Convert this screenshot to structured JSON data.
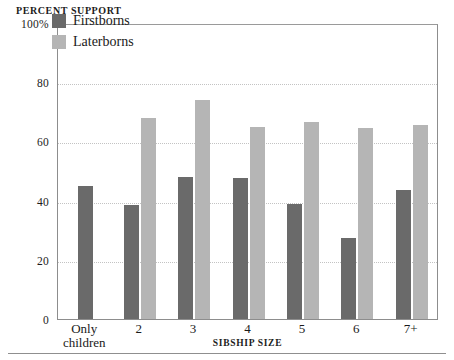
{
  "chart_data": {
    "type": "bar",
    "title": "",
    "ylabel": "PERCENT SUPPORT",
    "xlabel": "SIBSHIP SIZE",
    "ylim": [
      0,
      100
    ],
    "yticks": [
      0,
      20,
      40,
      60,
      80,
      100
    ],
    "ytick_labels": [
      "0",
      "20",
      "40",
      "60",
      "80",
      "100%"
    ],
    "grid": true,
    "grid_style": "dotted-horizontal",
    "legend_position": "top-left-inside",
    "categories": [
      "Only children",
      "2",
      "3",
      "4",
      "5",
      "6",
      "7+"
    ],
    "series": [
      {
        "name": "Firstborns",
        "color": "#6a6a6a",
        "values": [
          45,
          38.5,
          48,
          47.5,
          39,
          27.5,
          43.5
        ]
      },
      {
        "name": "Laterborns",
        "color": "#b5b5b5",
        "values": [
          null,
          68,
          74,
          65,
          66.5,
          64.5,
          65.5
        ]
      }
    ]
  },
  "legend": {
    "items": [
      {
        "label": "Firstborns",
        "swatch": "firstborn"
      },
      {
        "label": "Laterborns",
        "swatch": "laterborn"
      }
    ]
  },
  "colors": {
    "firstborn": "#6a6a6a",
    "laterborn": "#b5b5b5",
    "frame": "#8d8d8d",
    "gridline": "#c3c3c3",
    "text": "#1a1a1a",
    "background": "#ffffff"
  }
}
